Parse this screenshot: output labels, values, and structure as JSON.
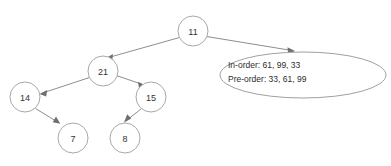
{
  "diagram": {
    "colors": {
      "node_fill": "#ffffff",
      "node_stroke": "#a8a8a8",
      "edge_stroke": "#8e8e8e",
      "text": "#333333",
      "callout_stroke": "#a0a0a0",
      "background": "#ffffff"
    },
    "nodes": [
      {
        "id": "n11",
        "label": "11",
        "cx": 193,
        "cy": 31,
        "r": 15
      },
      {
        "id": "n21",
        "label": "21",
        "cx": 103,
        "cy": 71,
        "r": 15
      },
      {
        "id": "n14",
        "label": "14",
        "cx": 25,
        "cy": 97,
        "r": 15
      },
      {
        "id": "n15",
        "label": "15",
        "cx": 151,
        "cy": 97,
        "r": 15
      },
      {
        "id": "n7",
        "label": "7",
        "cx": 73,
        "cy": 138,
        "r": 15
      },
      {
        "id": "n8",
        "label": "8",
        "cx": 125,
        "cy": 138,
        "r": 15
      }
    ],
    "edges": [
      {
        "id": "e-11-21",
        "from": "11",
        "to": "21"
      },
      {
        "id": "e-11-callout",
        "from": "11",
        "to": "callout"
      },
      {
        "id": "e-21-14",
        "from": "21",
        "to": "14"
      },
      {
        "id": "e-21-15",
        "from": "21",
        "to": "15"
      },
      {
        "id": "e-14-7",
        "from": "14",
        "to": "7"
      },
      {
        "id": "e-15-8",
        "from": "15",
        "to": "8"
      }
    ],
    "callout": {
      "cx": 303,
      "cy": 75,
      "rx": 83,
      "ry": 23,
      "line1": "In-order: 61, 99, 33",
      "line2": "Pre-order: 33, 61, 99"
    }
  }
}
